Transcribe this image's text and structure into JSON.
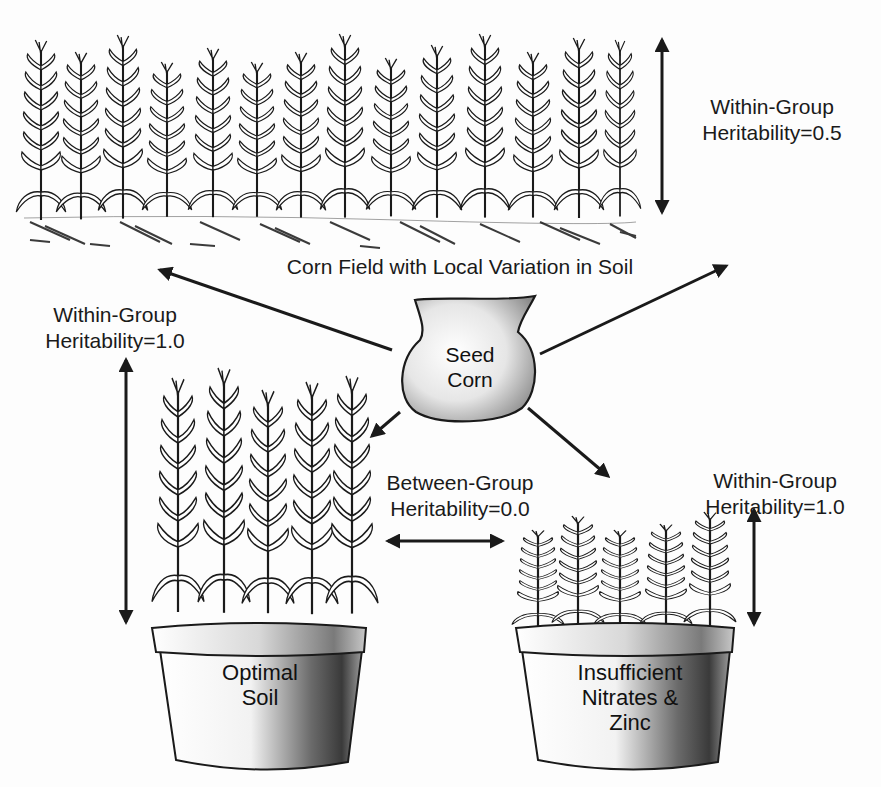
{
  "diagram": {
    "field": {
      "caption": "Corn Field with Local Variation in Soil",
      "heritability": {
        "line1": "Within-Group",
        "line2": "Heritability=0.5"
      }
    },
    "seed_bag": {
      "line1": "Seed",
      "line2": "Corn"
    },
    "optimal_pot": {
      "line1": "Optimal",
      "line2": "Soil",
      "heritability": {
        "line1": "Within-Group",
        "line2": "Heritability=1.0"
      }
    },
    "deficient_pot": {
      "line1": "Insufficient",
      "line2": "Nitrates &",
      "line3": "Zinc",
      "heritability": {
        "line1": "Within-Group",
        "line2": "Heritability=1.0"
      }
    },
    "between_group": {
      "line1": "Between-Group",
      "line2": "Heritability=0.0"
    },
    "colors": {
      "ink": "#1a1a1a",
      "paper": "#fdfdfd",
      "shade": "#555555"
    }
  }
}
